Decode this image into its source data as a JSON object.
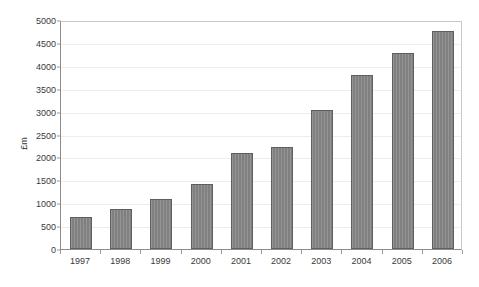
{
  "chart_data": {
    "type": "bar",
    "title": "",
    "subtitle": "",
    "xlabel": "",
    "ylabel": "£m",
    "categories": [
      "1997",
      "1998",
      "1999",
      "2000",
      "2001",
      "2002",
      "2003",
      "2004",
      "2005",
      "2006"
    ],
    "values": [
      700,
      880,
      1090,
      1420,
      2100,
      2230,
      3030,
      3790,
      4280,
      4760
    ],
    "series": [
      {
        "name": "£m",
        "values": [
          700,
          880,
          1090,
          1420,
          2100,
          2230,
          3030,
          3790,
          4280,
          4760
        ]
      }
    ],
    "ylim": [
      0,
      5000
    ],
    "ytick_step": 500,
    "ytick_labels": [
      "0",
      "500",
      "1000",
      "1500",
      "2000",
      "2500",
      "3000",
      "3500",
      "4000",
      "4500",
      "5000"
    ],
    "ytick_values": [
      0,
      500,
      1000,
      1500,
      2000,
      2500,
      3000,
      3500,
      4000,
      4500,
      5000
    ],
    "grid": true,
    "grid_axis": "y",
    "legend": false,
    "legend_position": "none",
    "bar_color": "#808080",
    "bar_border_color": "#5f5f5f",
    "gridline_color": "#ededed",
    "axis_color": "#8c8c8c",
    "text_color": "#3a3a3a",
    "background": "#ffffff",
    "annotations": []
  }
}
